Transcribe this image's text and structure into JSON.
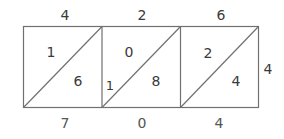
{
  "diagram": {
    "type": "lattice-multiplication",
    "multiplicand_digits": [
      "4",
      "2",
      "6"
    ],
    "multiplier_digit": "4",
    "cells": [
      {
        "upper": "1",
        "lower": "6"
      },
      {
        "upper": "0",
        "lower": "8"
      },
      {
        "upper": "2",
        "lower": "4"
      }
    ],
    "carry_left": "1",
    "result_bottom": [
      "7",
      "0",
      "4"
    ],
    "colors": {
      "stroke": "#707070",
      "text": "#3a3a3a"
    }
  }
}
